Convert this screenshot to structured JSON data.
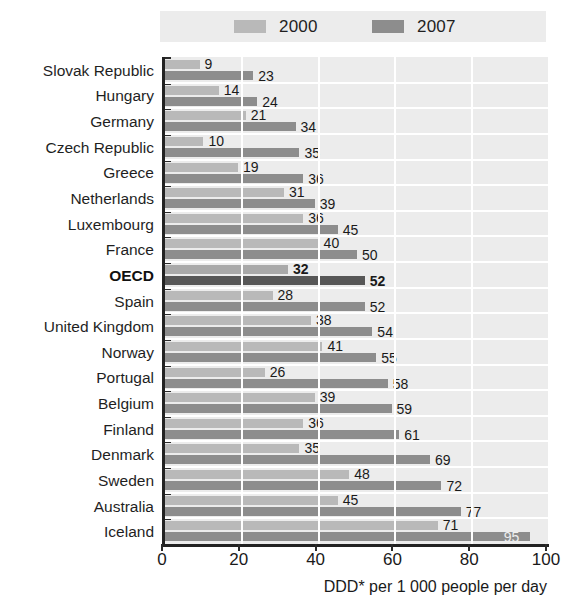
{
  "chart_data": {
    "type": "bar",
    "orientation": "horizontal",
    "title": "",
    "xlabel": "DDD* per 1 000 people per day",
    "ylabel": "",
    "xlim": [
      0,
      100
    ],
    "xticks": [
      0,
      20,
      40,
      60,
      80,
      100
    ],
    "grid": "vertical-white-gridlines",
    "legend_position": "top",
    "highlight_category": "OECD",
    "categories": [
      "Slovak Republic",
      "Hungary",
      "Germany",
      "Czech Republic",
      "Greece",
      "Netherlands",
      "Luxembourg",
      "France",
      "OECD",
      "Spain",
      "United Kingdom",
      "Norway",
      "Portugal",
      "Belgium",
      "Finland",
      "Denmark",
      "Sweden",
      "Australia",
      "Iceland"
    ],
    "series": [
      {
        "name": "2000",
        "color": "#b9b9b9",
        "values": [
          9,
          14,
          21,
          10,
          19,
          31,
          36,
          40,
          32,
          28,
          38,
          41,
          26,
          39,
          36,
          35,
          48,
          45,
          71
        ]
      },
      {
        "name": "2007",
        "color": "#8d8d8d",
        "values": [
          23,
          24,
          34,
          35,
          36,
          39,
          45,
          50,
          52,
          52,
          54,
          55,
          58,
          59,
          61,
          69,
          72,
          77,
          95
        ]
      }
    ]
  },
  "legend": {
    "items": [
      {
        "label": "2000",
        "color": "#b9b9b9"
      },
      {
        "label": "2007",
        "color": "#8d8d8d"
      }
    ]
  },
  "axis": {
    "x_title": "DDD* per 1 000 people per day",
    "x_tick_labels": [
      "0",
      "20",
      "40",
      "60",
      "80",
      "100"
    ]
  },
  "colors": {
    "plot_background": "#ececec",
    "gridline": "#ffffff",
    "axis_line": "#222222",
    "series_2000": "#b9b9b9",
    "series_2007": "#8d8d8d",
    "highlight_2000": "#a9a9a9",
    "highlight_2007": "#575757",
    "text": "#1a1a1a"
  }
}
